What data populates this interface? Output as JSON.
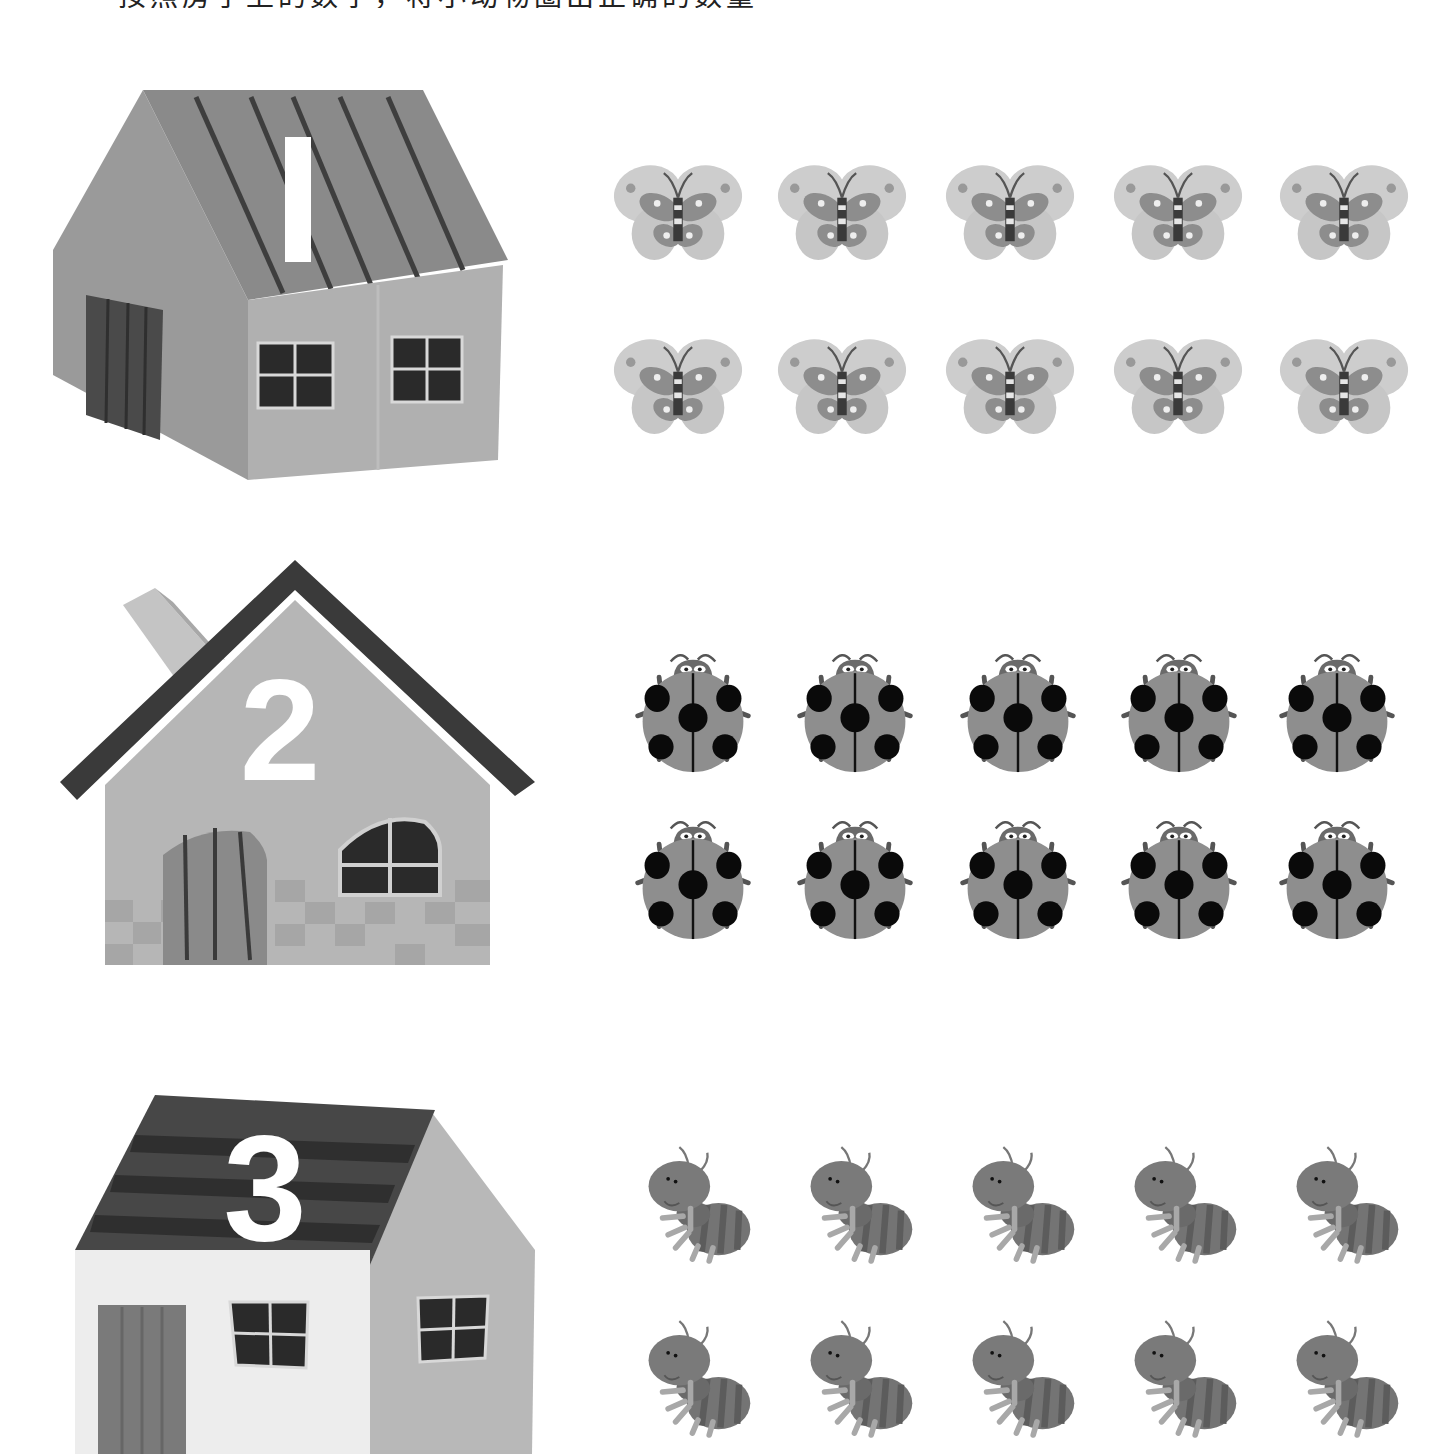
{
  "page": {
    "instruction_clipped": "按照房子上的数字，将小动物圈出正确的数量",
    "colors": {
      "background": "#ffffff",
      "house1_roof": "#8c8c8c",
      "house1_wall": "#a9a9a9",
      "house2_roof": "#3a3a3a",
      "house2_wall": "#b4b4b4",
      "house3_roof": "#474747",
      "house3_front": "#ececec",
      "butterfly_wing": "#c9c9c9",
      "ladybug_shell": "#8e8e8e",
      "ant_body": "#767676"
    }
  },
  "rows": [
    {
      "house": {
        "number": "1",
        "style": "striped-roof-house"
      },
      "animal": "butterfly",
      "count": 10,
      "layout": "2 rows x 5"
    },
    {
      "house": {
        "number": "2",
        "style": "chimney-house"
      },
      "animal": "ladybug",
      "count": 10,
      "layout": "2 rows x 5"
    },
    {
      "house": {
        "number": "3",
        "style": "tall-house"
      },
      "animal": "ant",
      "count": 10,
      "layout": "2 rows x 5"
    }
  ]
}
